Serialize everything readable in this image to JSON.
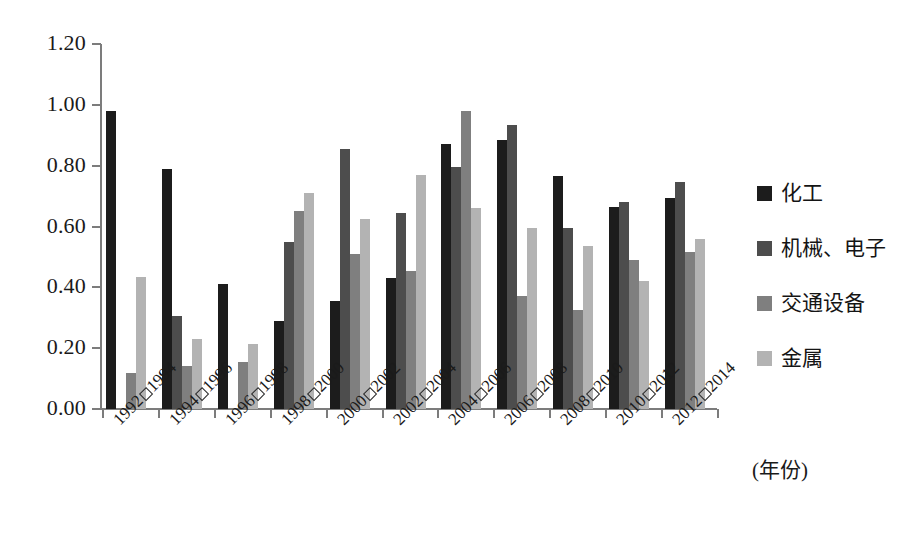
{
  "chart_data": {
    "type": "bar",
    "title": "",
    "subtitle": "",
    "xlabel": "(年份)",
    "ylabel": "",
    "ylim": [
      0.0,
      1.2
    ],
    "ytick_labels": [
      "0.00",
      "0.20",
      "0.40",
      "0.60",
      "0.80",
      "1.00",
      "1.20"
    ],
    "ytick_values": [
      0.0,
      0.2,
      0.4,
      0.6,
      0.8,
      1.0,
      1.2
    ],
    "grid": false,
    "legend_position": "right",
    "categories": [
      "1992□1994",
      "1994□1996",
      "1996□1998",
      "1998□2000",
      "2000□2002",
      "2002□2004",
      "2004□2006",
      "2006□2008",
      "2008□2010",
      "2010□2012",
      "2012□2014"
    ],
    "series": [
      {
        "name": "化工",
        "color": "#1c1c1c",
        "values": [
          0.98,
          0.79,
          0.41,
          0.29,
          0.355,
          0.43,
          0.87,
          0.885,
          0.765,
          0.665,
          0.695
        ]
      },
      {
        "name": "机械、电子",
        "color": "#4d4d4d",
        "values": [
          null,
          0.305,
          null,
          0.55,
          0.855,
          0.645,
          0.795,
          0.935,
          0.595,
          0.68,
          0.745
        ]
      },
      {
        "name": "交通设备",
        "color": "#7f7f7f",
        "values": [
          0.12,
          0.14,
          0.155,
          0.65,
          0.51,
          0.455,
          0.98,
          0.37,
          0.325,
          0.49,
          0.515
        ]
      },
      {
        "name": "金属",
        "color": "#b3b3b3",
        "values": [
          0.435,
          0.23,
          0.215,
          0.71,
          0.625,
          0.77,
          0.66,
          0.595,
          0.535,
          0.42,
          0.56
        ]
      }
    ]
  },
  "axis": {
    "tick_color": "#7c7c7c"
  }
}
